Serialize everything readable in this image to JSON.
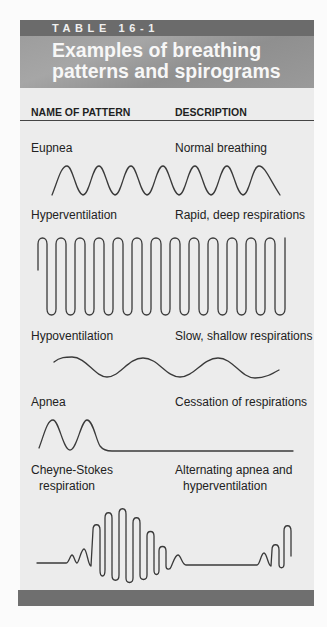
{
  "table": {
    "number": "TABLE 16-1",
    "title": "Examples of breathing patterns and spirograms",
    "columns": {
      "name": "NAME OF PATTERN",
      "description": "DESCRIPTION"
    },
    "rows": [
      {
        "name": "Eupnea",
        "description": "Normal breathing",
        "spirogram": "eupnea-waveform"
      },
      {
        "name": "Hyperventilation",
        "description": "Rapid, deep respirations",
        "spirogram": "hyperventilation-waveform"
      },
      {
        "name": "Hypoventilation",
        "description": "Slow, shallow respirations",
        "spirogram": "hypoventilation-waveform"
      },
      {
        "name": "Apnea",
        "description": "Cessation of respirations",
        "spirogram": "apnea-waveform"
      },
      {
        "name_line1": "Cheyne-Stokes",
        "name_line2": "respiration",
        "description_line1": "Alternating apnea and",
        "description_line2": "hyperventilation",
        "spirogram": "cheyne-stokes-waveform"
      }
    ]
  },
  "colors": {
    "header_strip": "#6b6b6b",
    "title_block": "#9d9d9d",
    "panel_background": "#ececec",
    "footer_bar": "#6f6f6f",
    "waveform": "#3a3a3a"
  }
}
